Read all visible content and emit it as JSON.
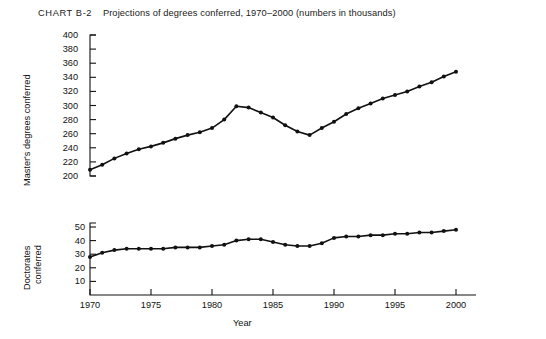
{
  "chart_title": {
    "label": "CHART B-2",
    "text": "Projections of degrees conferred, 1970–2000 (numbers in thousands)"
  },
  "axis": {
    "xlabel": "Year",
    "xticks": [
      "1970",
      "1975",
      "1980",
      "1985",
      "1990",
      "1995",
      "2000"
    ],
    "top_ylabel": "Master's degrees conferred",
    "top_yticks": [
      "400",
      "380",
      "360",
      "340",
      "320",
      "300",
      "280",
      "260",
      "240",
      "220",
      "200"
    ],
    "bottom_ylabel_line1": "Doctorates",
    "bottom_ylabel_line2": "conferred",
    "bottom_yticks": [
      "50",
      "40",
      "30",
      "20",
      "10"
    ]
  },
  "chart_data": [
    {
      "type": "line",
      "title": "Master's degrees conferred",
      "subtitle": "CHART B-2  Projections of degrees conferred, 1970–2000 (numbers in thousands)",
      "xlabel": "Year",
      "ylabel": "Master's degrees conferred",
      "xlim": [
        1970,
        2000
      ],
      "ylim": [
        200,
        400
      ],
      "grid": false,
      "legend": "none",
      "markers": true,
      "x": [
        1970,
        1971,
        1972,
        1973,
        1974,
        1975,
        1976,
        1977,
        1978,
        1979,
        1980,
        1981,
        1982,
        1983,
        1984,
        1985,
        1986,
        1987,
        1988,
        1989,
        1990,
        1991,
        1992,
        1993,
        1994,
        1995,
        1996,
        1997,
        1998,
        1999,
        2000
      ],
      "values": [
        209,
        216,
        225,
        232,
        238,
        242,
        247,
        253,
        258,
        262,
        268,
        280,
        299,
        297,
        290,
        283,
        272,
        263,
        258,
        268,
        277,
        288,
        296,
        303,
        310,
        315,
        320,
        327,
        333,
        341,
        348
      ]
    },
    {
      "type": "line",
      "title": "Doctorates conferred",
      "xlabel": "Year",
      "ylabel": "Doctorates conferred",
      "xlim": [
        1970,
        2000
      ],
      "ylim": [
        0,
        50
      ],
      "grid": false,
      "legend": "none",
      "markers": true,
      "x": [
        1970,
        1971,
        1972,
        1973,
        1974,
        1975,
        1976,
        1977,
        1978,
        1979,
        1980,
        1981,
        1982,
        1983,
        1984,
        1985,
        1986,
        1987,
        1988,
        1989,
        1990,
        1991,
        1992,
        1993,
        1994,
        1995,
        1996,
        1997,
        1998,
        1999,
        2000
      ],
      "values": [
        28,
        31,
        33,
        34,
        34,
        34,
        34,
        35,
        35,
        35,
        36,
        37,
        40,
        41,
        41,
        39,
        37,
        36,
        36,
        38,
        42,
        43,
        43,
        44,
        44,
        45,
        45,
        46,
        46,
        47,
        48
      ]
    }
  ],
  "colors": {
    "ink": "#111111",
    "background": "#ffffff"
  }
}
